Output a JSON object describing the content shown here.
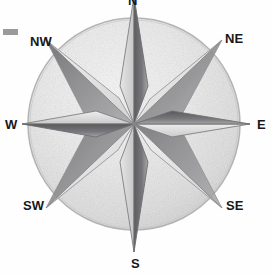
{
  "image": {
    "title": "Hand-drawn pencil compass rose",
    "medium": "pencil sketch on white paper",
    "width": 271,
    "height": 277,
    "background_color": "#fefefe"
  },
  "compass": {
    "center_x": 134,
    "center_y": 124,
    "circle_radius": 106,
    "circle_stroke_color": "#b9b9b9",
    "circle_fill_color": "#eeeeee",
    "graphite_dark": "#5a5a5c",
    "graphite_mid": "#8e8e90",
    "graphite_light": "#d2d2d3",
    "outline_color": "#7b7b7d",
    "major_point_radius": 128,
    "minor_point_radius": 100,
    "points": [
      {
        "id": "n",
        "label": "N",
        "angle_deg": 0,
        "kind": "major",
        "tip_x": 134,
        "tip_y": -4
      },
      {
        "id": "ne",
        "label": "NE",
        "angle_deg": 45,
        "kind": "minor",
        "tip_x": 222,
        "tip_y": 40
      },
      {
        "id": "e",
        "label": "E",
        "angle_deg": 90,
        "kind": "major",
        "tip_x": 250,
        "tip_y": 124
      },
      {
        "id": "se",
        "label": "SE",
        "angle_deg": 135,
        "kind": "minor",
        "tip_x": 222,
        "tip_y": 208
      },
      {
        "id": "s",
        "label": "S",
        "angle_deg": 180,
        "kind": "major",
        "tip_x": 134,
        "tip_y": 252
      },
      {
        "id": "sw",
        "label": "SW",
        "angle_deg": 225,
        "kind": "minor",
        "tip_x": 46,
        "tip_y": 208
      },
      {
        "id": "w",
        "label": "W",
        "angle_deg": 270,
        "kind": "major",
        "tip_x": 22,
        "tip_y": 124
      },
      {
        "id": "nw",
        "label": "NW",
        "angle_deg": 315,
        "kind": "minor",
        "tip_x": 46,
        "tip_y": 40
      }
    ]
  },
  "labels": {
    "n": "N",
    "ne": "NE",
    "e": "E",
    "se": "SE",
    "s": "S",
    "sw": "SW",
    "w": "W",
    "nw": "NW"
  },
  "artifacts": {
    "corner_mark_color": "#9a9a9a"
  }
}
